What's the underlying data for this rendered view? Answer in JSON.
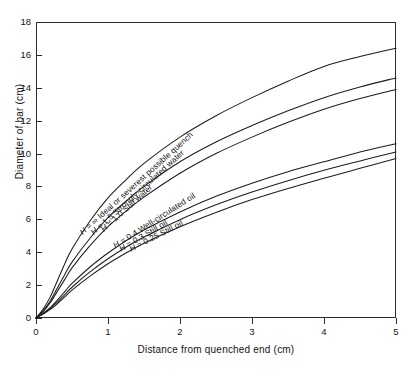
{
  "chart_data": {
    "type": "line",
    "title": "",
    "xlabel": "Distance from quenched end (cm)",
    "ylabel": "Diameter of bar (cm)",
    "xlim": [
      0,
      5
    ],
    "ylim": [
      0,
      18
    ],
    "xticks": [
      "0",
      "1",
      "2",
      "3",
      "4",
      "5"
    ],
    "yticks": [
      "0",
      "2",
      "4",
      "6",
      "8",
      "10",
      "12",
      "14",
      "16",
      "18"
    ],
    "grid": false,
    "legend_position": "inline-on-curves",
    "x": [
      0,
      0.1,
      0.2,
      0.3,
      0.4,
      0.5,
      0.75,
      1.0,
      1.25,
      1.5,
      2.0,
      2.5,
      3.0,
      3.5,
      4.0,
      4.5,
      5.0
    ],
    "series": [
      {
        "name": "H = ∞ Ideal or severest possible quench",
        "label": "H = ∞ Ideal or severest possible quench",
        "values": [
          0.0,
          0.55,
          1.3,
          2.3,
          3.3,
          4.2,
          5.9,
          7.3,
          8.4,
          9.4,
          11.0,
          12.3,
          13.4,
          14.4,
          15.3,
          15.9,
          16.4
        ]
      },
      {
        "name": "H = 1.5 Strongly-circulated water",
        "label": "H = 1.5 Strongly-circulated water",
        "values": [
          0.0,
          0.45,
          1.05,
          1.85,
          2.65,
          3.4,
          4.85,
          6.1,
          7.1,
          8.0,
          9.5,
          10.7,
          11.7,
          12.6,
          13.4,
          14.05,
          14.6
        ]
      },
      {
        "name": "H = 1.0 Still water",
        "label": "H = 1.0 Still water",
        "values": [
          0.0,
          0.4,
          0.95,
          1.65,
          2.35,
          3.05,
          4.4,
          5.55,
          6.5,
          7.35,
          8.8,
          10.0,
          11.0,
          11.9,
          12.7,
          13.35,
          13.9
        ]
      },
      {
        "name": "H = 0.4 Well-circulated oil",
        "label": "H = 0.4 Well-circulated oil",
        "values": [
          0.0,
          0.3,
          0.65,
          1.1,
          1.6,
          2.1,
          3.1,
          3.95,
          4.7,
          5.35,
          6.45,
          7.4,
          8.2,
          8.9,
          9.5,
          10.1,
          10.6
        ]
      },
      {
        "name": "H = 0.3 Still oil",
        "label": "H = 0.3 Still oil",
        "values": [
          0.0,
          0.27,
          0.58,
          0.98,
          1.42,
          1.87,
          2.8,
          3.6,
          4.3,
          4.92,
          5.98,
          6.88,
          7.66,
          8.35,
          8.98,
          9.55,
          10.1
        ]
      },
      {
        "name": "H = 0.25 Still oil",
        "label": "H = 0.25 Still oil",
        "values": [
          0.0,
          0.24,
          0.52,
          0.88,
          1.28,
          1.7,
          2.55,
          3.3,
          3.95,
          4.55,
          5.55,
          6.42,
          7.2,
          7.88,
          8.5,
          9.1,
          9.7
        ]
      }
    ],
    "annotations": [
      {
        "text": "H = ∞ Ideal or severest possible quench",
        "for_series": 0
      },
      {
        "text": "H = 1.5 Strongly-circulated water",
        "for_series": 1
      },
      {
        "text": "H = 1.0 Still water",
        "for_series": 2
      },
      {
        "text": "H = 0.4 Well-circulated oil",
        "for_series": 3
      },
      {
        "text": "H = 0.3 Still oil",
        "for_series": 4
      },
      {
        "text": "H = 0.25 Still oil",
        "for_series": 5
      }
    ]
  },
  "axes": {
    "x_title": "Distance from quenched end (cm)",
    "y_title": "Diameter of bar (cm)"
  },
  "labels": {
    "c0": "H = ∞ Ideal or severest possible quench",
    "c1": "H = 1.5 Strongly-circulated water",
    "c2": "H = 1.0 Still water",
    "c3": "H = 0.4 Well-circulated oil",
    "c4": "H = 0.3 Still oil",
    "c5": "H = 0.25 Still oil"
  }
}
